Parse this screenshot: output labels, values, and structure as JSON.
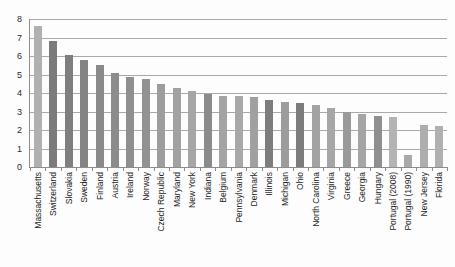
{
  "chart_data": {
    "type": "bar",
    "title": "",
    "subtitle": "",
    "xlabel": "",
    "ylabel": "",
    "ylim": [
      0,
      8
    ],
    "y_ticks": [
      0,
      1,
      2,
      3,
      4,
      5,
      6,
      7,
      8
    ],
    "grid": true,
    "legend": "none",
    "orientation": "vertical",
    "tick_label_rotation": -90,
    "categories": [
      "Massachusetts",
      "Switzerland",
      "Slovakia",
      "Sweden",
      "Finland",
      "Austria",
      "Ireland",
      "Norway",
      "Czech Republic",
      "Maryland",
      "New York",
      "Indiana",
      "Belgium",
      "Pennsylvania",
      "Denmark",
      "Illinois",
      "Michigan",
      "Ohio",
      "North Carolina",
      "Virginia",
      "Greece",
      "Georgia",
      "Hungary",
      "Portugal (2008)",
      "Portugal (1990)",
      "New Jersey",
      "Florida"
    ],
    "values": [
      7.6,
      6.8,
      6.05,
      5.8,
      5.5,
      5.1,
      4.85,
      4.75,
      4.5,
      4.25,
      4.1,
      3.95,
      3.85,
      3.85,
      3.8,
      3.6,
      3.5,
      3.45,
      3.35,
      3.2,
      3.0,
      2.85,
      2.75,
      2.7,
      0.65,
      2.25,
      2.2
    ],
    "bar_colors": [
      "#b0b0b0",
      "#7b7b7b",
      "#7f7f7f",
      "#848484",
      "#8a8a8a",
      "#8c8c8c",
      "#8f8f8f",
      "#929292",
      "#9d9d9d",
      "#a2a2a2",
      "#a6a6a6",
      "#8b8b8b",
      "#a4a4a4",
      "#a8a8a8",
      "#a0a0a0",
      "#7d7d7d",
      "#9c9c9c",
      "#7c7c7c",
      "#a3a3a3",
      "#a6a6a6",
      "#9a9a9a",
      "#a5a5a5",
      "#8f8f8f",
      "#b4b4b4",
      "#a9a9a9",
      "#adadad",
      "#b0b0b0"
    ],
    "colors": {
      "gridline": "#a9a9a9",
      "axis": "#8d8d8d",
      "text": "#1e1e1e",
      "background": "#fdfdfd"
    }
  }
}
